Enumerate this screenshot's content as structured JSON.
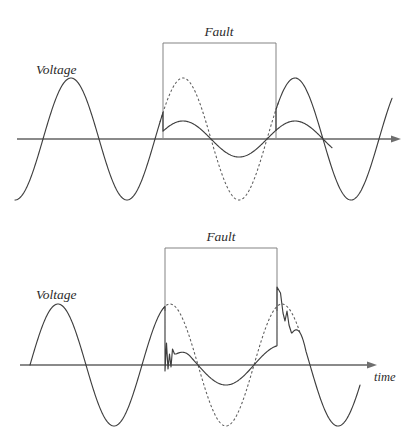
{
  "figure": {
    "title_visible": false,
    "background": "#ffffff",
    "width": 413,
    "height": 447
  },
  "colors": {
    "axis": "#8a8a8a",
    "waveform": "#3e3e3e",
    "waveform_dashed": "#5a5a5a",
    "bracket": "#7d7d7d",
    "text": "#2b2b2b"
  },
  "panels": [
    {
      "id": "top",
      "name": "voltage-sag-without-transients",
      "labels": {
        "voltage": "Voltage",
        "fault": "Fault",
        "time": ""
      },
      "axis": {
        "x1": 17,
        "x2": 392,
        "y": 139,
        "arrow": true
      },
      "bracket": {
        "x1": 163,
        "x2": 276,
        "y": 43,
        "y_bottom": 139
      },
      "fault_label_pos": {
        "x": 219,
        "y": 36
      },
      "voltage_label_pos": {
        "x": 36,
        "y": 74
      }
    },
    {
      "id": "bottom",
      "name": "voltage-sag-with-transients",
      "labels": {
        "voltage": "Voltage",
        "fault": "Fault",
        "time": "time"
      },
      "axis": {
        "x1": 20,
        "x2": 368,
        "y": 142,
        "arrow": true
      },
      "bracket": {
        "x1": 165,
        "x2": 277,
        "y": 25,
        "y_bottom": 88
      },
      "fault_label_pos": {
        "x": 221,
        "y": 18
      },
      "voltage_label_pos": {
        "x": 36,
        "y": 76
      },
      "time_label_pos": {
        "x": 374,
        "y": 158
      }
    }
  ],
  "chart_data": {
    "type": "line",
    "xlabel": "time",
    "ylabel": "Voltage",
    "grid": false,
    "legend": "none",
    "annotations": [
      "Fault",
      "Voltage",
      "time"
    ],
    "charts": [
      {
        "id": "top",
        "description": "Ideal voltage sag: amplitude drops to ~30% during the fault interval, no transients.",
        "axis_y": 139,
        "amplitude_nominal": 61,
        "amplitude_sag": 18,
        "period": 112,
        "phase_x0": 15,
        "fault_start_x": 163,
        "fault_end_x": 276,
        "wave_start_x": 15,
        "wave_end_x": 392,
        "series": [
          {
            "name": "voltage-with-sag",
            "style": "solid"
          },
          {
            "name": "nominal-reference",
            "style": "dashed",
            "x_range": [
              163,
              276
            ]
          },
          {
            "name": "sag-tail",
            "style": "solid",
            "x_range": [
              276,
              332
            ]
          }
        ]
      },
      {
        "id": "bottom",
        "description": "Voltage sag with switching transients at fault initiation and clearing; step drop at fault start with damped ringing, step rise and overshoot spike at fault clearing.",
        "axis_y": 142,
        "amplitude_nominal": 61,
        "amplitude_sag": 20,
        "period": 112,
        "phase_x0": 30,
        "fault_start_x": 165,
        "fault_end_x": 277,
        "wave_start_x": 30,
        "wave_end_x": 360,
        "transient_initiation": {
          "drop_from_y": 88,
          "drop_to_y": 148,
          "ring_peaks_y": [
            120,
            131,
            126
          ]
        },
        "transient_clearing": {
          "rise_from_y": 133,
          "spike_peak_y": 64,
          "secondary_peak_y": 98
        },
        "series": [
          {
            "name": "voltage-with-sag-and-transients",
            "style": "solid"
          },
          {
            "name": "nominal-reference",
            "style": "dashed",
            "x_range": [
              165,
              300
            ]
          }
        ]
      }
    ]
  }
}
